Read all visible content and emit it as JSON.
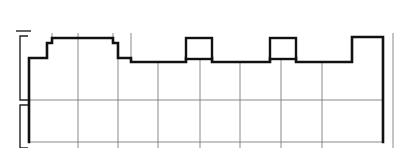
{
  "document": {
    "title": "Building Floor Plan Outline",
    "type": "architectural-line-drawing",
    "canvas_width": 407,
    "canvas_height": 148,
    "background_color": "#ffffff"
  },
  "style": {
    "outer_wall_color": "#111111",
    "outer_wall_width": 2.6,
    "interior_grid_color": "#7d7d7d",
    "interior_grid_width": 0.9,
    "dimension_color": "#222222",
    "dimension_width": 1.4,
    "column_fill": "#ffffff",
    "column_stroke": "#111111",
    "column_stroke_width": 2.4
  },
  "chart_data": {
    "type": "line",
    "title": "Building Floor Plan Outline",
    "xlabel": "",
    "ylabel": "",
    "grid": true,
    "legend": "none",
    "xlim": [
      0,
      407
    ],
    "ylim": [
      0,
      148
    ],
    "outer_wall_path": "M 29 142 L 29 58 L 47 58 L 47 43 L 52 43 L 52 38 L 113 38 L 113 43 L 118 43 L 118 58 L 131 58 L 131 62 L 186 62 L 186 58 L 212 58 L 212 62 L 270 62 L 270 58 L 296 58 L 296 62 L 352 62 L 352 37 L 383 37 L 383 142",
    "columns": [
      {
        "name": "column-left",
        "x": 186,
        "y": 38,
        "w": 26,
        "h": 21
      },
      {
        "name": "column-right",
        "x": 270,
        "y": 38,
        "w": 26,
        "h": 21
      }
    ],
    "vertical_grid_x": [
      78,
      118,
      158,
      200,
      240,
      281,
      322
    ],
    "horizontal_grid_y": [
      100,
      142
    ],
    "stub_lines": [
      {
        "name": "stub-notch-tall",
        "x1": 131,
        "y1": 33,
        "x2": 131,
        "y2": 62
      },
      {
        "name": "stub-raised-tick",
        "x1": 78,
        "y1": 33,
        "x2": 78,
        "y2": 38
      },
      {
        "name": "stub-raised-left",
        "x1": 52,
        "y1": 33,
        "x2": 52,
        "y2": 43
      },
      {
        "name": "stub-raised-right",
        "x1": 113,
        "y1": 33,
        "x2": 113,
        "y2": 43
      },
      {
        "name": "far-right-edge",
        "x1": 393,
        "y1": 33,
        "x2": 393,
        "y2": 148
      }
    ],
    "dimension_brackets": [
      {
        "name": "bracket-upper",
        "x": 20,
        "y_top": 36,
        "y_bottom": 100,
        "arm": 8
      },
      {
        "name": "bracket-lower",
        "x": 20,
        "y_top": 105,
        "y_bottom": 148,
        "arm": 8
      }
    ],
    "dimension_ticks": [
      {
        "name": "tick-top",
        "x1": 16,
        "y1": 31,
        "x2": 31,
        "y2": 31
      }
    ]
  }
}
